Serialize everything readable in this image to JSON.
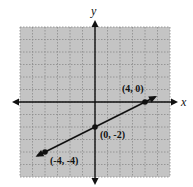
{
  "chart_data": {
    "type": "line",
    "title": "",
    "xlabel": "x",
    "ylabel": "y",
    "xlim": [
      -6,
      6
    ],
    "ylim": [
      -6,
      6
    ],
    "grid": true,
    "grid_step": 1,
    "series": [
      {
        "name": "line",
        "equation": "y = 0.5x - 2",
        "x": [
          -4.6,
          -4,
          0,
          4,
          4.8
        ],
        "y": [
          -4.3,
          -4,
          -2,
          0,
          0.4
        ],
        "arrows": "both"
      }
    ],
    "points": [
      {
        "x": 4,
        "y": 0,
        "label": "(4, 0)"
      },
      {
        "x": 0,
        "y": -2,
        "label": "(0, -2)"
      },
      {
        "x": -4,
        "y": -4,
        "label": "(-4, -4)"
      }
    ]
  },
  "axes": {
    "x_label": "x",
    "y_label": "y"
  },
  "style": {
    "grid_bg": "#c4c4c4",
    "grid_line": "#8a8a8a",
    "ink": "#111111"
  },
  "layout": {
    "origin_px": [
      95,
      102
    ],
    "unit_px": 12.5,
    "grid_box": [
      20,
      27,
      170,
      177
    ],
    "x_axis": [
      12,
      178
    ],
    "y_axis": [
      20,
      185
    ]
  }
}
